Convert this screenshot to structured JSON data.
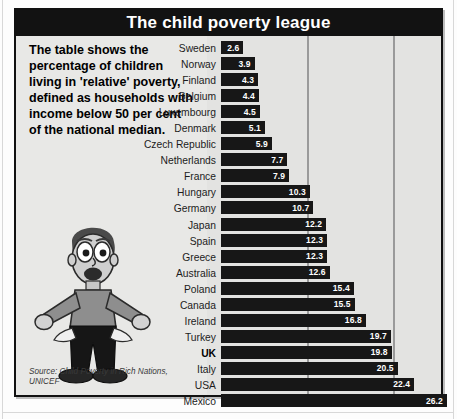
{
  "title": "The child poverty league",
  "blurb": "The table shows the percentage of children living in 'relative' poverty, defined as households with income below 50 per cent of the national median.",
  "source": "Source: Child Poverty in Rich Nations, UNICEF",
  "illustration": "cartoon-man-empty-pockets",
  "colors": {
    "title_bar": "#121212",
    "bar": "#171717",
    "panel_bg": "#e8e8e6",
    "chart_bg": "#e3e3e1",
    "gridline": "#9a9a9a",
    "value_text": "#ffffff"
  },
  "chart_data": {
    "type": "bar",
    "orientation": "horizontal",
    "title": "The child poverty league",
    "xlabel": "",
    "ylabel": "",
    "xlim": [
      0,
      27
    ],
    "grid": true,
    "gridlines": [
      10,
      20
    ],
    "legend": "none",
    "highlight": "UK",
    "unit": "per cent of children in relative poverty",
    "categories": [
      "Sweden",
      "Norway",
      "Finland",
      "Belgium",
      "Luxembourg",
      "Denmark",
      "Czech Republic",
      "Netherlands",
      "France",
      "Hungary",
      "Germany",
      "Japan",
      "Spain",
      "Greece",
      "Australia",
      "Poland",
      "Canada",
      "Ireland",
      "Turkey",
      "UK",
      "Italy",
      "USA",
      "Mexico"
    ],
    "values": [
      2.6,
      3.9,
      4.3,
      4.4,
      4.5,
      5.1,
      5.9,
      7.7,
      7.9,
      10.3,
      10.7,
      12.2,
      12.3,
      12.3,
      12.6,
      15.4,
      15.5,
      16.8,
      19.7,
      19.8,
      20.5,
      22.4,
      26.2
    ]
  }
}
